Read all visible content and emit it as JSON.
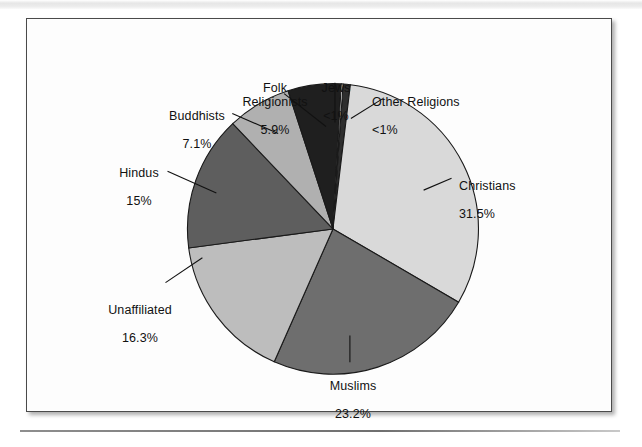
{
  "page": {
    "background_color": "#ffffff",
    "caption_fragment": ""
  },
  "figure": {
    "border_color": "#4a4a4a",
    "background_color": "#fdfdfd"
  },
  "chart_data": {
    "type": "pie",
    "title": "",
    "subtitle": "",
    "xlabel": "",
    "ylabel": "",
    "legend_position": "callout-labels",
    "grid": false,
    "start_angle_deg": -86,
    "direction": "clockwise",
    "categories": [
      "Other Religions",
      "Christians",
      "Muslims",
      "Unaffiliated",
      "Hindus",
      "Buddhists",
      "Folk Religionists",
      "Jews"
    ],
    "values": [
      0.8,
      31.5,
      23.2,
      16.3,
      15.0,
      7.1,
      5.9,
      0.2
    ],
    "value_labels": [
      "<1%",
      "31.5%",
      "23.2%",
      "16.3%",
      "15%",
      "7.1%",
      "5.9%",
      "<1%"
    ],
    "colors": [
      "#2e2e2e",
      "#d9d9d9",
      "#6e6e6e",
      "#bdbdbd",
      "#5e5e5e",
      "#b0b0b0",
      "#1f1f1f",
      "#ffffff"
    ],
    "slice_border_color": "#1a1a1a",
    "units": "percent"
  },
  "labels": [
    {
      "name": "folk-religionists",
      "title": "Folk\nReligionists",
      "value": "5.9%"
    },
    {
      "name": "jews",
      "title": "Jews",
      "value": "<1%"
    },
    {
      "name": "other-religions",
      "title": "Other Religions",
      "value": "<1%"
    },
    {
      "name": "buddhists",
      "title": "Buddhists",
      "value": "7.1%"
    },
    {
      "name": "hindus",
      "title": "Hindus",
      "value": "15%"
    },
    {
      "name": "unaffiliated",
      "title": "Unaffiliated",
      "value": "16.3%"
    },
    {
      "name": "muslims",
      "title": "Muslims",
      "value": "23.2%"
    },
    {
      "name": "christians",
      "title": "Christians",
      "value": "31.5%"
    }
  ]
}
